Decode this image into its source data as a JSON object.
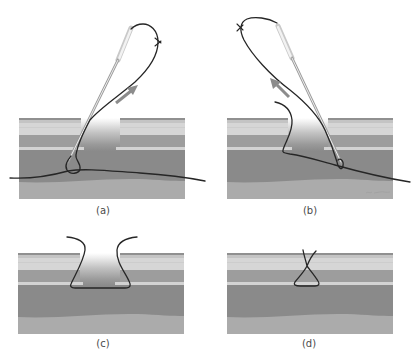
{
  "figure": {
    "panels": [
      {
        "id": "a",
        "label": "(a)",
        "arrow_direction": "up-right"
      },
      {
        "id": "b",
        "label": "(b)",
        "arrow_direction": "up-left"
      },
      {
        "id": "c",
        "label": "(c)"
      },
      {
        "id": "d",
        "label": "(d)"
      }
    ],
    "colors": {
      "background": "#ffffff",
      "thread": "#262626",
      "arrow": "#8c8c8c",
      "layer_top_edge": "#909090",
      "layer_upper_light": "#c4c4c4",
      "layer_epidermis": "#d6d6d6",
      "layer_dermis": "#9d9d9d",
      "layer_stripe": "#d3d3d3",
      "layer_deep": "#8a8a8a",
      "layer_bottom": "#ababab"
    }
  }
}
